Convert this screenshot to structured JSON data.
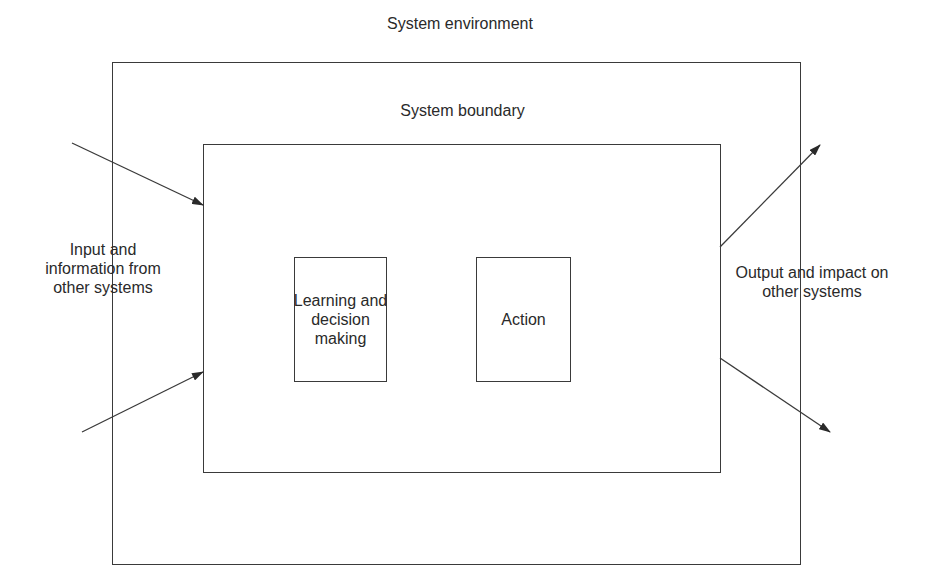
{
  "diagram": {
    "title": "System environment",
    "boundary_label": "System boundary",
    "components": [
      {
        "id": "learning",
        "label": "Learning and\ndecision\nmaking"
      },
      {
        "id": "action",
        "label": "Action"
      }
    ],
    "inputs_label": "Input and\ninformation from\nother systems",
    "outputs_label": "Output and impact on\nother systems",
    "arrows": [
      {
        "name": "input-arrow-top",
        "from": [
          72,
          143
        ],
        "to": [
          203,
          205
        ]
      },
      {
        "name": "input-arrow-bottom",
        "from": [
          82,
          432
        ],
        "to": [
          203,
          372
        ]
      },
      {
        "name": "output-arrow-top",
        "from": [
          720,
          247
        ],
        "to": [
          820,
          145
        ]
      },
      {
        "name": "output-arrow-bottom",
        "from": [
          720,
          358
        ],
        "to": [
          830,
          432
        ]
      }
    ],
    "colors": {
      "line": "#3a3a3a",
      "text": "#2a2a2a",
      "background": "#ffffff"
    }
  }
}
